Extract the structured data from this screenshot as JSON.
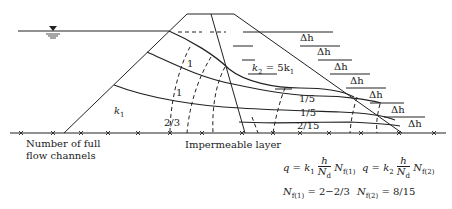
{
  "diagram": {
    "labels": {
      "k1": "k",
      "k1_sub": "1",
      "k2_eq": "k",
      "k2_sub": "2",
      "k2_rhs": " = 5k",
      "k2_rhs_sub": "1",
      "impermeable_layer": "Impermeable layer",
      "flow_channels_line1": "Number of full",
      "flow_channels_line2": "flow channels"
    },
    "channel_numbers": {
      "upstream": [
        "1",
        "1",
        "2/3"
      ],
      "downstream": [
        "1/5",
        "1/5",
        "2/15"
      ]
    },
    "head_drop_label": "Δh",
    "head_drop_count": 7,
    "equations": {
      "q1": {
        "lhs": "q = k",
        "k_sub": "1",
        "num": "h",
        "den": "N",
        "den_sub": "d",
        "nf": "N",
        "nf_sub": "f(1)"
      },
      "q2": {
        "lhs": "q = k",
        "k_sub": "2",
        "num": "h",
        "den": "N",
        "den_sub": "d",
        "nf": "N",
        "nf_sub": "f(2)"
      },
      "nf1": {
        "sym": "N",
        "sub": "f(1)",
        "value": " = 2−2/3"
      },
      "nf2": {
        "sym": "N",
        "sub": "f(2)",
        "value": " = 8/15"
      }
    },
    "colors": {
      "line": "#222222",
      "background": "#ffffff"
    }
  }
}
